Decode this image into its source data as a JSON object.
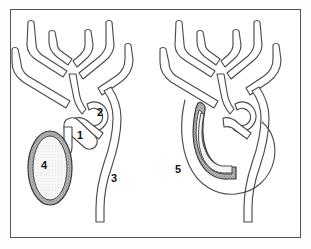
{
  "figure": {
    "panels": [
      {
        "id": "left-panel",
        "name": "detached-gallbladder-panel",
        "description": "Biliary ductal tree with separate oval gallbladder"
      },
      {
        "id": "right-panel",
        "name": "elongated-gallbladder-panel",
        "description": "Biliary ductal tree with elongated gallbladder along duct"
      }
    ],
    "labels": [
      {
        "key": "1",
        "text": "1",
        "x": 80,
        "y": 139,
        "panel": "left",
        "name": "label-1-cystic-duct"
      },
      {
        "key": "2",
        "text": "2",
        "x": 100,
        "y": 116,
        "panel": "left",
        "name": "label-2-duct-junction"
      },
      {
        "key": "3",
        "text": "3",
        "x": 114,
        "y": 182,
        "panel": "left",
        "name": "label-3-common-bile-duct"
      },
      {
        "key": "4",
        "text": "4",
        "x": 44,
        "y": 169,
        "panel": "left",
        "name": "label-4-gallbladder"
      },
      {
        "key": "5",
        "text": "5",
        "x": 178,
        "y": 173,
        "panel": "right",
        "name": "label-5-elongated-gallbladder"
      }
    ],
    "colors": {
      "frame_border": "#555557",
      "panel_background": "#ffffff",
      "duct_stroke": "#4c4c4e",
      "gallbladder_wall": "#a8a8a8",
      "gallbladder_lumen": "#f2f2f2",
      "label_text": "#121214"
    }
  }
}
